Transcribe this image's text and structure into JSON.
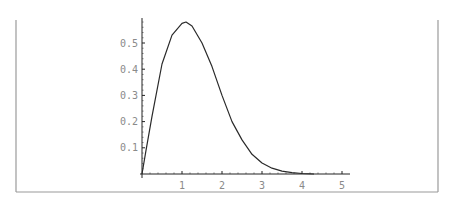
{
  "chart_data": {
    "type": "line",
    "title": "",
    "xlabel": "",
    "ylabel": "",
    "xlim": [
      0,
      5
    ],
    "ylim": [
      0,
      0.58
    ],
    "grid": false,
    "legend": null,
    "x_ticks": [
      "1",
      "2",
      "3",
      "4",
      "5"
    ],
    "y_ticks": [
      "0.1",
      "0.2",
      "0.3",
      "0.4",
      "0.5"
    ],
    "series": [
      {
        "name": "density",
        "x": [
          0,
          0.1,
          0.25,
          0.5,
          0.75,
          1.0,
          1.1,
          1.25,
          1.5,
          1.75,
          2.0,
          2.25,
          2.5,
          2.75,
          3.0,
          3.25,
          3.5,
          3.75,
          4.0,
          4.3
        ],
        "y": [
          0,
          0.09,
          0.22,
          0.42,
          0.53,
          0.575,
          0.58,
          0.565,
          0.5,
          0.41,
          0.3,
          0.2,
          0.13,
          0.075,
          0.042,
          0.022,
          0.011,
          0.005,
          0.002,
          0.0
        ]
      }
    ]
  }
}
